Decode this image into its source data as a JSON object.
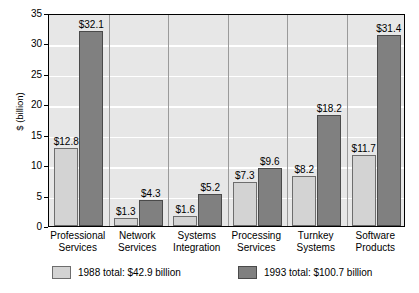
{
  "chart_data": {
    "type": "bar",
    "title": "",
    "subtitle": "",
    "xlabel": "",
    "ylabel": "$ (billion)",
    "ylim": [
      0,
      35
    ],
    "ytick_step": 5,
    "yticks": [
      0,
      5,
      10,
      15,
      20,
      25,
      30,
      35
    ],
    "ytick_labels": [
      "0",
      "5",
      "10",
      "15",
      "20",
      "25",
      "30",
      "35"
    ],
    "grid": "horizontal-white-gridlines",
    "legend_position": "bottom",
    "categories": [
      "Professional Services",
      "Network Services",
      "Systems Integration",
      "Processing Services",
      "Turnkey Systems",
      "Software Products"
    ],
    "category_lines": [
      [
        "Professional",
        "Services"
      ],
      [
        "Network",
        "Services"
      ],
      [
        "Systems",
        "Integration"
      ],
      [
        "Processing",
        "Services"
      ],
      [
        "Turnkey",
        "Systems"
      ],
      [
        "Software",
        "Products"
      ]
    ],
    "series": [
      {
        "name": "1988",
        "legend_label": "1988 total: $42.9 billion",
        "color": "#d3d3d3",
        "values": [
          12.8,
          1.3,
          1.6,
          7.3,
          8.2,
          11.7
        ],
        "value_labels": [
          "$12.8",
          "$1.3",
          "$1.6",
          "$7.3",
          "$8.2",
          "$11.7"
        ],
        "total": "$42.9 billion"
      },
      {
        "name": "1993",
        "legend_label": "1993 total: $100.7 billion",
        "color": "#808080",
        "values": [
          32.1,
          4.3,
          5.2,
          9.6,
          18.2,
          31.4
        ],
        "value_labels": [
          "$32.1",
          "$4.3",
          "$5.2",
          "$9.6",
          "$18.2",
          "$31.4"
        ],
        "total": "$100.7 billion"
      }
    ]
  },
  "legend": {
    "entries": [
      {
        "label": "1988 total: $42.9 billion",
        "swatch": "s1988"
      },
      {
        "label": "1993 total: $100.7 billion",
        "swatch": "s1993"
      }
    ]
  }
}
